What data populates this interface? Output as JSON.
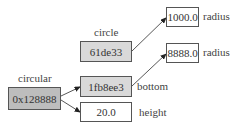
{
  "diagram": {
    "nodes": {
      "circular": {
        "name": "circular",
        "value": "0x128888"
      },
      "circle": {
        "name": "circle",
        "value": "61de33"
      },
      "bottom": {
        "value": "1fb8ee3",
        "field": "bottom"
      },
      "height": {
        "value": "20.0",
        "field": "height"
      },
      "circle_radius": {
        "value": "1000.0",
        "field": "radius"
      },
      "bottom_radius": {
        "value": "8888.0",
        "field": "radius"
      }
    },
    "colors": {
      "pointer_fill_dark": "#bdbdbd",
      "pointer_fill_light": "#d9d9d9",
      "value_fill": "#ffffff",
      "stroke": "#555555"
    }
  }
}
